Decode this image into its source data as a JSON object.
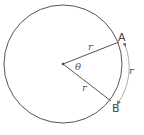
{
  "diagram": {
    "colors": {
      "stroke": "#555555",
      "arrow": "#777777",
      "background": "#ffffff"
    },
    "circle": {
      "cx": 63,
      "cy": 64,
      "r": 59
    },
    "center_point": {
      "x": 63,
      "y": 64
    },
    "points": [
      {
        "name": "A",
        "x": 119,
        "y": 42,
        "label": "A"
      },
      {
        "name": "B",
        "x": 111,
        "y": 101,
        "label": "B"
      }
    ],
    "labels": {
      "radius_to_a": "r",
      "radius_to_b": "r",
      "arc": "r",
      "angle": "θ",
      "point_a": "A",
      "point_b": "B"
    }
  }
}
